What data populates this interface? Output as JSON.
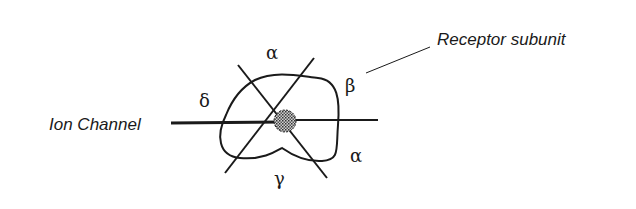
{
  "diagram": {
    "labels": {
      "receptor_subunit": "Receptor subunit",
      "ion_channel": "Ion Channel"
    },
    "subunits": [
      {
        "id": "alpha_top",
        "symbol": "α"
      },
      {
        "id": "beta",
        "symbol": "β"
      },
      {
        "id": "delta",
        "symbol": "δ"
      },
      {
        "id": "alpha_bottom",
        "symbol": "α"
      },
      {
        "id": "gamma",
        "symbol": "γ"
      }
    ],
    "colors": {
      "ink": "#1a1a1a",
      "background": "#ffffff",
      "channel_fill": "#9a9a9a"
    }
  }
}
